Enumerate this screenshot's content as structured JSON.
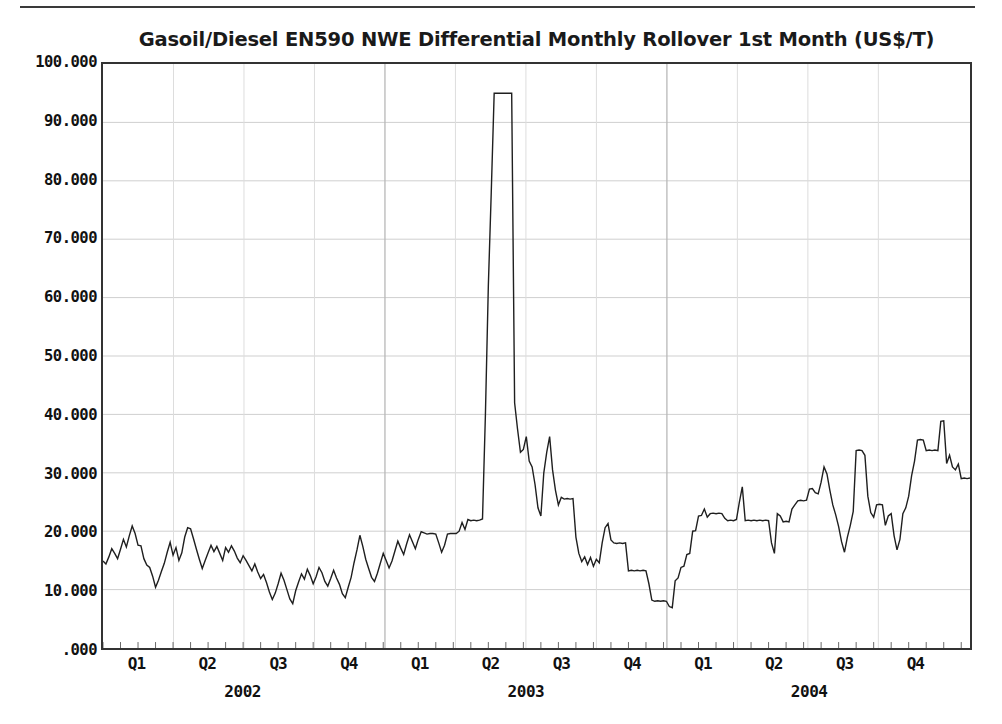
{
  "chart_data": {
    "type": "line",
    "title": "Gasoil/Diesel EN590 NWE Differential Monthly Rollover 1st Month (US$/T)",
    "xlabel": "",
    "ylabel": "",
    "ylim": [
      0,
      100
    ],
    "grid": true,
    "legend": "none",
    "y_ticks": [
      {
        "value": 100,
        "label": "100.000"
      },
      {
        "value": 90,
        "label": "90.000"
      },
      {
        "value": 80,
        "label": "80.000"
      },
      {
        "value": 70,
        "label": "70.000"
      },
      {
        "value": 60,
        "label": "60.000"
      },
      {
        "value": 50,
        "label": "50.000"
      },
      {
        "value": 40,
        "label": "40.000"
      },
      {
        "value": 30,
        "label": "30.000"
      },
      {
        "value": 20,
        "label": "20.000"
      },
      {
        "value": 10,
        "label": "10.000"
      },
      {
        "value": 0,
        "label": ".000"
      }
    ],
    "x_ticks": [
      {
        "pos": 0.5,
        "label": "Q1"
      },
      {
        "pos": 1.5,
        "label": "Q2"
      },
      {
        "pos": 2.5,
        "label": "Q3"
      },
      {
        "pos": 3.5,
        "label": "Q4"
      },
      {
        "pos": 4.5,
        "label": "Q1"
      },
      {
        "pos": 5.5,
        "label": "Q2"
      },
      {
        "pos": 6.5,
        "label": "Q3"
      },
      {
        "pos": 7.5,
        "label": "Q4"
      },
      {
        "pos": 8.5,
        "label": "Q1"
      },
      {
        "pos": 9.5,
        "label": "Q2"
      },
      {
        "pos": 10.5,
        "label": "Q3"
      },
      {
        "pos": 11.5,
        "label": "Q4"
      }
    ],
    "x_year_labels": [
      {
        "pos": 2.0,
        "label": "2002"
      },
      {
        "pos": 6.0,
        "label": "2003"
      },
      {
        "pos": 10.0,
        "label": "2004"
      }
    ],
    "x_quarter_gridlines": [
      1,
      2,
      3,
      5,
      6,
      7,
      9,
      10,
      11
    ],
    "x_year_gridlines": [
      4,
      8
    ],
    "x_range": [
      0,
      12.3
    ],
    "series_color": "#1f1f1f",
    "series_name": "Gasoil/Diesel EN590 NWE Differential",
    "values": [
      14.9,
      14.4,
      15.6,
      17.0,
      16.2,
      15.3,
      16.9,
      18.6,
      17.3,
      19.2,
      20.9,
      19.6,
      17.6,
      17.5,
      15.3,
      14.2,
      13.8,
      12.3,
      10.4,
      11.6,
      13.1,
      14.5,
      16.4,
      18.1,
      15.9,
      17.2,
      15.0,
      16.3,
      19.0,
      20.6,
      20.4,
      18.7,
      16.9,
      15.2,
      13.6,
      15.0,
      16.3,
      17.6,
      16.5,
      17.4,
      16.2,
      15.0,
      17.2,
      16.4,
      17.5,
      16.6,
      15.4,
      14.6,
      15.8,
      15.0,
      14.1,
      13.2,
      14.4,
      13.0,
      11.9,
      12.6,
      11.2,
      9.6,
      8.3,
      9.4,
      11.0,
      12.8,
      11.6,
      10.0,
      8.4,
      7.6,
      9.8,
      11.3,
      12.7,
      11.8,
      13.5,
      12.4,
      11.0,
      12.2,
      13.8,
      12.9,
      11.4,
      10.6,
      11.9,
      13.3,
      12.0,
      10.9,
      9.3,
      8.6,
      10.4,
      12.1,
      14.6,
      16.8,
      19.3,
      17.4,
      15.2,
      13.6,
      12.1,
      11.4,
      12.8,
      14.5,
      16.2,
      15.0,
      13.7,
      14.9,
      16.6,
      18.3,
      17.1,
      16.0,
      17.8,
      19.4,
      18.2,
      17.0,
      18.6,
      19.9,
      19.7,
      19.5,
      19.6,
      19.6,
      19.5,
      18.0,
      16.4,
      17.6,
      19.5,
      19.6,
      19.6,
      19.6,
      20.0,
      21.5,
      20.3,
      22.0,
      21.8,
      21.9,
      21.8,
      21.9,
      22.1,
      40.0,
      62.0,
      78.0,
      95.0,
      95.0,
      95.0,
      95.0,
      95.0,
      95.0,
      95.0,
      42.0,
      37.5,
      33.5,
      34.0,
      36.2,
      32.0,
      31.0,
      28.0,
      24.0,
      22.6,
      30.0,
      33.5,
      36.2,
      30.5,
      27.0,
      24.5,
      25.8,
      25.5,
      25.6,
      25.5,
      25.6,
      19.0,
      16.2,
      14.8,
      15.6,
      14.3,
      15.5,
      14.0,
      15.2,
      14.6,
      18.0,
      20.6,
      21.3,
      18.5,
      18.0,
      17.9,
      18.0,
      17.9,
      18.0,
      13.2,
      13.3,
      13.2,
      13.3,
      13.2,
      13.3,
      13.2,
      11.0,
      8.2,
      8.0,
      8.1,
      8.0,
      8.1,
      8.0,
      7.1,
      6.9,
      11.5,
      12.0,
      13.8,
      14.0,
      16.0,
      16.2,
      20.0,
      20.1,
      22.6,
      22.7,
      23.8,
      22.4,
      23.0,
      23.1,
      23.0,
      23.1,
      23.0,
      22.2,
      21.8,
      21.9,
      21.8,
      22.0,
      25.0,
      27.6,
      21.8,
      21.9,
      21.8,
      21.9,
      21.8,
      21.9,
      21.8,
      21.9,
      21.8,
      18.0,
      16.2,
      23.0,
      22.6,
      21.6,
      21.7,
      21.6,
      23.8,
      24.5,
      25.2,
      25.3,
      25.2,
      25.3,
      27.2,
      27.3,
      26.6,
      26.4,
      28.4,
      31.0,
      29.8,
      27.0,
      24.5,
      22.8,
      20.8,
      18.2,
      16.4,
      19.0,
      21.0,
      23.4,
      33.8,
      33.9,
      33.8,
      33.0,
      26.0,
      23.2,
      22.4,
      24.5,
      24.6,
      24.5,
      21.0,
      22.6,
      23.0,
      19.2,
      16.8,
      18.6,
      23.0,
      24.0,
      26.0,
      29.5,
      32.0,
      35.6,
      35.7,
      35.6,
      33.8,
      33.9,
      33.8,
      33.9,
      33.8,
      38.8,
      38.9,
      31.6,
      33.0,
      31.0,
      30.5,
      31.5,
      29.0,
      29.1,
      29.0,
      29.1
    ]
  }
}
